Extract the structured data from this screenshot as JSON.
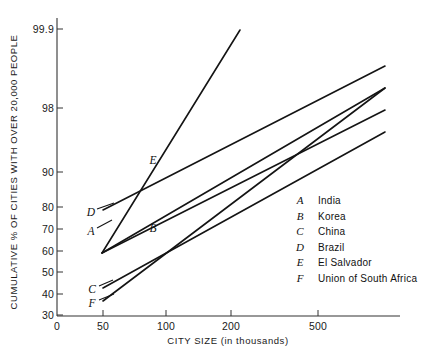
{
  "chart_data": {
    "type": "line",
    "title": "",
    "xlabel": "CITY SIZE (in thousands)",
    "ylabel": "CUMULATIVE % OF CITIES WITH OVER 20,000 PEOPLE",
    "x_scale": "log",
    "y_scale": "probability",
    "grid": false,
    "legend_position": "inside-right",
    "xticks": [
      {
        "label": "0",
        "value": 0,
        "px": 57
      },
      {
        "label": "50",
        "value": 50,
        "px": 103
      },
      {
        "label": "100",
        "value": 100,
        "px": 166
      },
      {
        "label": "200",
        "value": 200,
        "px": 231
      },
      {
        "label": "500",
        "value": 500,
        "px": 318
      }
    ],
    "yticks": [
      {
        "label": "99.9",
        "value": 99.9,
        "px": 29
      },
      {
        "label": "98",
        "value": 98,
        "px": 108
      },
      {
        "label": "90",
        "value": 90,
        "px": 172
      },
      {
        "label": "80",
        "value": 80,
        "px": 207
      },
      {
        "label": "70",
        "value": 70,
        "px": 229
      },
      {
        "label": "60",
        "value": 60,
        "px": 251
      },
      {
        "label": "50",
        "value": 50,
        "px": 272
      },
      {
        "label": "40",
        "value": 40,
        "px": 294
      },
      {
        "label": "30",
        "value": 30,
        "px": 315
      }
    ],
    "origin_label": "0",
    "xlim_px": [
      57,
      400
    ],
    "ylim_px": [
      29,
      315
    ],
    "series": [
      {
        "key": "A",
        "name": "India",
        "label_pos_px": {
          "x": 91,
          "y": 231
        },
        "leader_px": [
          [
            97,
            228
          ],
          [
            112,
            220
          ]
        ],
        "points_px": [
          [
            102,
            253
          ],
          [
            385,
            88
          ]
        ],
        "points_data": [
          [
            50,
            59
          ],
          [
            900,
            98.5
          ]
        ]
      },
      {
        "key": "B",
        "name": "Korea",
        "label_pos_px": {
          "x": 153,
          "y": 228
        },
        "leader_px": [],
        "points_px": [
          [
            102,
            253
          ],
          [
            385,
            110
          ]
        ],
        "points_data": [
          [
            50,
            59
          ],
          [
            900,
            96
          ]
        ]
      },
      {
        "key": "C",
        "name": "China",
        "label_pos_px": {
          "x": 92,
          "y": 289
        },
        "leader_px": [
          [
            99,
            286
          ],
          [
            113,
            280
          ]
        ],
        "points_px": [
          [
            103,
            288
          ],
          [
            385,
            132
          ]
        ],
        "points_data": [
          [
            50,
            41
          ],
          [
            900,
            93
          ]
        ]
      },
      {
        "key": "D",
        "name": "Brazil",
        "label_pos_px": {
          "x": 91,
          "y": 212
        },
        "leader_px": [
          [
            97,
            209
          ],
          [
            114,
            203
          ]
        ],
        "points_px": [
          [
            103,
            210
          ],
          [
            385,
            66
          ]
        ],
        "points_data": [
          [
            50,
            79
          ],
          [
            900,
            99.3
          ]
        ]
      },
      {
        "key": "E",
        "name": "El Salvador",
        "label_pos_px": {
          "x": 153,
          "y": 160
        },
        "leader_px": [],
        "points_px": [
          [
            102,
            253
          ],
          [
            240,
            30
          ]
        ],
        "points_data": [
          [
            50,
            59
          ],
          [
            215,
            99.9
          ]
        ]
      },
      {
        "key": "F",
        "name": "Union of South Africa",
        "label_pos_px": {
          "x": 92,
          "y": 303
        },
        "leader_px": [
          [
            99,
            300
          ],
          [
            114,
            294
          ]
        ],
        "points_px": [
          [
            103,
            301
          ],
          [
            385,
            88
          ]
        ],
        "points_data": [
          [
            50,
            36
          ],
          [
            900,
            98.5
          ]
        ]
      }
    ],
    "legend": [
      {
        "key": "A",
        "name": "India"
      },
      {
        "key": "B",
        "name": "Korea"
      },
      {
        "key": "C",
        "name": "China"
      },
      {
        "key": "D",
        "name": "Brazil"
      },
      {
        "key": "E",
        "name": "El Salvador"
      },
      {
        "key": "F",
        "name": "Union of South Africa"
      }
    ],
    "legend_origin_px": {
      "x": 300,
      "y": 204,
      "row_height": 15.5,
      "name_x": 318
    }
  }
}
